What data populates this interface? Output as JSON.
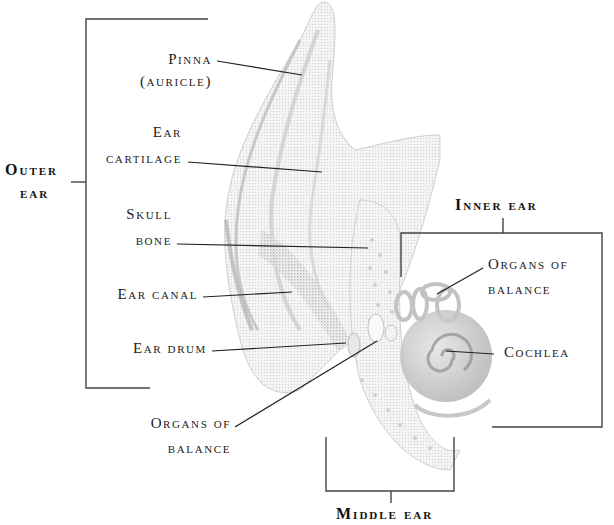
{
  "diagram": {
    "type": "anatomical-illustration",
    "groups": [
      {
        "id": "outer",
        "label_line1": "Outer",
        "label_line2": "ear"
      },
      {
        "id": "inner",
        "label": "Inner ear"
      },
      {
        "id": "middle",
        "label": "Middle ear"
      }
    ],
    "labels": {
      "pinna_1": "Pinna",
      "pinna_2": "(auricle)",
      "cartilage_1": "Ear",
      "cartilage_2": "cartilage",
      "skull_1": "Skull",
      "skull_2": "bone",
      "canal": "Ear canal",
      "drum": "Ear drum",
      "balance_left_1": "Organs of",
      "balance_left_2": "balance",
      "balance_right_1": "Organs of",
      "balance_right_2": "balance",
      "cochlea": "Cochlea"
    },
    "colors": {
      "ink": "#222222",
      "bracket": "#444444",
      "shading": "#bdbdbd"
    }
  }
}
